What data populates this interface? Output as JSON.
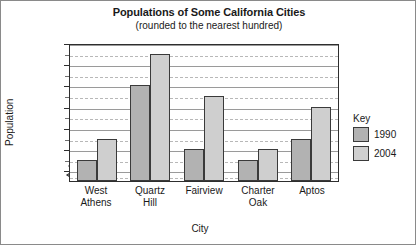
{
  "chart_data": {
    "type": "bar",
    "title": "Populations of Some California Cities",
    "subtitle": "(rounded to the nearest hundred)",
    "xlabel": "City",
    "ylabel": "Population",
    "categories": [
      "West Athens",
      "Quartz Hill",
      "Fairview",
      "Charter Oak",
      "Aptos"
    ],
    "series": [
      {
        "name": "1990",
        "color": "#b2b2b2",
        "values": [
          8900,
          9600,
          9000,
          8900,
          9100
        ]
      },
      {
        "name": "2004",
        "color": "#cfcfcf",
        "values": [
          9100,
          9900,
          9500,
          9000,
          9400
        ]
      }
    ],
    "ylim": [
      8700,
      10000
    ],
    "y_axis_break": true,
    "ytick_labels": [
      "10,000",
      "9800",
      "9600",
      "9400",
      "9200",
      "9000",
      "8800"
    ],
    "ytick_values": [
      10000,
      9800,
      9600,
      9400,
      9200,
      9000,
      8800
    ],
    "grid": "horizontal solid at labeled ticks, dashed at midpoints",
    "legend": {
      "title": "Key",
      "position": "right"
    }
  },
  "legend": {
    "title": "Key",
    "entries": [
      {
        "label": "1990"
      },
      {
        "label": "2004"
      }
    ]
  },
  "xticks": [
    {
      "line1": "West",
      "line2": "Athens"
    },
    {
      "line1": "Quartz",
      "line2": "Hill"
    },
    {
      "line1": "Fairview",
      "line2": ""
    },
    {
      "line1": "Charter",
      "line2": "Oak"
    },
    {
      "line1": "Aptos",
      "line2": ""
    }
  ]
}
